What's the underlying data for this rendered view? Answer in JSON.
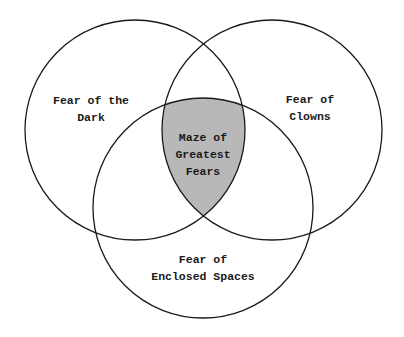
{
  "diagram": {
    "type": "venn",
    "colors": {
      "background": "#ffffff",
      "stroke": "#1a1a1a",
      "intersection_fill": "#b8b8b8",
      "text": "#1a1a1a"
    },
    "sets": [
      {
        "id": "dark",
        "label_lines": [
          "Fear of the",
          "Dark"
        ]
      },
      {
        "id": "clowns",
        "label_lines": [
          "Fear of",
          "Clowns"
        ]
      },
      {
        "id": "enclosed",
        "label_lines": [
          "Fear of",
          "Enclosed Spaces"
        ]
      }
    ],
    "intersection": {
      "sets": [
        "dark",
        "clowns",
        "enclosed"
      ],
      "label_lines": [
        "Maze of",
        "Greatest",
        "Fears"
      ],
      "shaded": true
    }
  }
}
